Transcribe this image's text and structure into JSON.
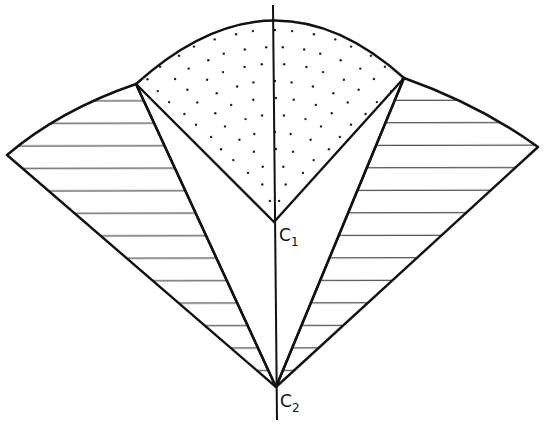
{
  "diagram": {
    "type": "geometric-construction",
    "labels": {
      "c1_main": "C",
      "c1_sub": "1",
      "c2_main": "C",
      "c2_sub": "2"
    },
    "points": {
      "C1": [
        274,
        222
      ],
      "C2": [
        276,
        387
      ],
      "left_inner_vertex": [
        136,
        84
      ],
      "right_inner_vertex": [
        404,
        78
      ],
      "left_outer_vertex": [
        7,
        155
      ],
      "right_outer_vertex": [
        538,
        147
      ],
      "axis_top": [
        273,
        5
      ],
      "axis_bottom": [
        277,
        420
      ]
    },
    "regions": [
      {
        "name": "central-sector",
        "fill": "dotted",
        "center": "C1"
      },
      {
        "name": "left-wing",
        "fill": "horizontal-hatch",
        "center": "C2"
      },
      {
        "name": "right-wing",
        "fill": "horizontal-hatch",
        "center": "C2"
      }
    ],
    "colors": {
      "line": "#111111",
      "background": "#ffffff"
    }
  }
}
